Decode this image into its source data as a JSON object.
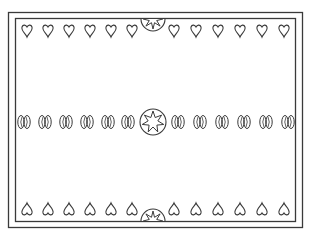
{
  "artwork": {
    "title": "Decorative border pattern",
    "stroke_color": "#3a3a3a",
    "background_color": "#ffffff",
    "top_row": {
      "motif": "heart-outline",
      "count_left": 6,
      "count_right": 6,
      "center": "half-medallion-top"
    },
    "middle_row": {
      "motif": "bean-pair",
      "count_left": 6,
      "count_right": 6,
      "center": "star-medallion"
    },
    "bottom_row": {
      "motif": "heart-inverted-outline",
      "count_left": 6,
      "count_right": 6,
      "center": "half-medallion-bottom"
    }
  }
}
